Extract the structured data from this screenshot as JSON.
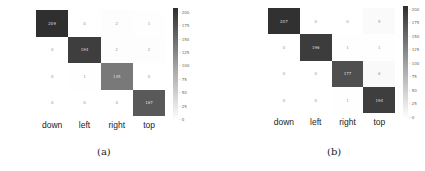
{
  "chart_data": [
    {
      "type": "heatmap",
      "title": "",
      "caption": "(a)",
      "row_labels": [
        "down",
        "left",
        "right",
        "top"
      ],
      "col_labels": [
        "down",
        "left",
        "right",
        "top"
      ],
      "values": [
        [
          209,
          0,
          2,
          1
        ],
        [
          0,
          194,
          2,
          2
        ],
        [
          0,
          1,
          135,
          0
        ],
        [
          0,
          0,
          0,
          167
        ]
      ],
      "colorbar": {
        "ticks": [
          "200",
          "175",
          "150",
          "125",
          "100",
          "75",
          "50",
          "25",
          "0"
        ],
        "range": [
          0,
          209
        ]
      }
    },
    {
      "type": "heatmap",
      "title": "",
      "caption": "(b)",
      "row_labels": [
        "down",
        "left",
        "right",
        "top"
      ],
      "col_labels": [
        "down",
        "left",
        "right",
        "top"
      ],
      "values": [
        [
          207,
          0,
          0,
          5
        ],
        [
          0,
          196,
          1,
          1
        ],
        [
          0,
          0,
          177,
          6
        ],
        [
          0,
          0,
          1,
          194
        ]
      ],
      "colorbar": {
        "ticks": [
          "200",
          "175",
          "150",
          "125",
          "100",
          "75",
          "50",
          "25",
          "0"
        ],
        "range": [
          0,
          207
        ]
      }
    }
  ]
}
